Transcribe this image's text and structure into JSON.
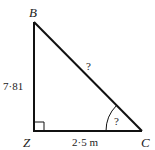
{
  "diagram": {
    "type": "right-triangle",
    "vertices": {
      "top": "B",
      "right_angle": "Z",
      "bottom_right": "C"
    },
    "sides": {
      "BZ": "7·81",
      "ZC": "2·5 m",
      "BC": "?"
    },
    "angle_C": "?",
    "right_angle_at": "Z",
    "stroke_color": "#111111"
  }
}
